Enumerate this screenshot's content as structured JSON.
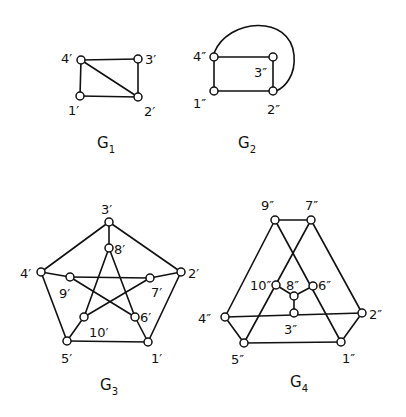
{
  "figure": {
    "width": 406,
    "height": 417,
    "ink_color": "#111111",
    "background": "#ffffff",
    "vertex_radius": 4
  },
  "graphs": [
    {
      "id": "G1",
      "title": "G",
      "subscript": "1",
      "title_pos": [
        97,
        148
      ],
      "vertices": [
        {
          "id": "1'",
          "label": "1'",
          "x": 80,
          "y": 96,
          "lx": 68,
          "ly": 115
        },
        {
          "id": "2'",
          "label": "2'",
          "x": 138,
          "y": 97,
          "lx": 144,
          "ly": 116
        },
        {
          "id": "3'",
          "label": "3'",
          "x": 138,
          "y": 59,
          "lx": 145,
          "ly": 64
        },
        {
          "id": "4'",
          "label": "4'",
          "x": 81,
          "y": 60,
          "lx": 61,
          "ly": 63
        }
      ],
      "edges": [
        [
          "4'",
          "3'"
        ],
        [
          "4'",
          "1'"
        ],
        [
          "1'",
          "2'"
        ],
        [
          "3'",
          "2'"
        ],
        [
          "4'",
          "2'"
        ]
      ],
      "arcs": []
    },
    {
      "id": "G2",
      "title": "G",
      "subscript": "2",
      "title_pos": [
        238,
        148
      ],
      "vertices": [
        {
          "id": "1''",
          "label": "1''",
          "x": 214,
          "y": 91,
          "lx": 193,
          "ly": 108
        },
        {
          "id": "2''",
          "label": "2''",
          "x": 273,
          "y": 91,
          "lx": 267,
          "ly": 114
        },
        {
          "id": "3''",
          "label": "3''",
          "x": 273,
          "y": 57,
          "lx": 254,
          "ly": 77
        },
        {
          "id": "4''",
          "label": "4''",
          "x": 214,
          "y": 57,
          "lx": 193,
          "ly": 61
        }
      ],
      "edges": [
        [
          "4''",
          "3''"
        ],
        [
          "4''",
          "1''"
        ],
        [
          "1''",
          "2''"
        ],
        [
          "3''",
          "2''"
        ]
      ],
      "arcs": [
        {
          "from": "4''",
          "to": "2''",
          "path": "M 214 53 C 228 18, 290 14, 294 55 C 296 76, 284 88, 276 91"
        }
      ]
    },
    {
      "id": "G3",
      "title": "G",
      "subscript": "3",
      "title_pos": [
        100,
        390
      ],
      "vertices": [
        {
          "id": "1'",
          "label": "1'",
          "x": 148,
          "y": 342,
          "lx": 151,
          "ly": 363
        },
        {
          "id": "2'",
          "label": "2'",
          "x": 181,
          "y": 272,
          "lx": 188,
          "ly": 278
        },
        {
          "id": "3'",
          "label": "3'",
          "x": 109,
          "y": 222,
          "lx": 101,
          "ly": 214
        },
        {
          "id": "4'",
          "label": "4'",
          "x": 41,
          "y": 272,
          "lx": 20,
          "ly": 278
        },
        {
          "id": "5'",
          "label": "5'",
          "x": 67,
          "y": 341,
          "lx": 61,
          "ly": 363
        },
        {
          "id": "6'",
          "label": "6'",
          "x": 135,
          "y": 317,
          "lx": 140,
          "ly": 322
        },
        {
          "id": "7'",
          "label": "7'",
          "x": 150,
          "y": 278,
          "lx": 151,
          "ly": 297
        },
        {
          "id": "8'",
          "label": "8'",
          "x": 109,
          "y": 248,
          "lx": 114,
          "ly": 254
        },
        {
          "id": "9'",
          "label": "9'",
          "x": 70,
          "y": 277,
          "lx": 59,
          "ly": 298
        },
        {
          "id": "10'",
          "label": "10'",
          "x": 84,
          "y": 317,
          "lx": 89,
          "ly": 337
        }
      ],
      "edges": [
        [
          "3'",
          "4'"
        ],
        [
          "3'",
          "2'"
        ],
        [
          "2'",
          "1'"
        ],
        [
          "1'",
          "5'"
        ],
        [
          "5'",
          "4'"
        ],
        [
          "3'",
          "8'"
        ],
        [
          "4'",
          "9'"
        ],
        [
          "2'",
          "7'"
        ],
        [
          "1'",
          "6'"
        ],
        [
          "5'",
          "10'"
        ],
        [
          "8'",
          "10'"
        ],
        [
          "8'",
          "6'"
        ],
        [
          "9'",
          "7'"
        ],
        [
          "9'",
          "6'"
        ],
        [
          "10'",
          "7'"
        ]
      ],
      "arcs": []
    },
    {
      "id": "G4",
      "title": "G",
      "subscript": "4",
      "title_pos": [
        290,
        387
      ],
      "vertices": [
        {
          "id": "1''",
          "label": "1''",
          "x": 341,
          "y": 342,
          "lx": 342,
          "ly": 363
        },
        {
          "id": "2''",
          "label": "2''",
          "x": 362,
          "y": 313,
          "lx": 369,
          "ly": 319
        },
        {
          "id": "3''",
          "label": "3''",
          "x": 294,
          "y": 313,
          "lx": 284,
          "ly": 334
        },
        {
          "id": "4''",
          "label": "4''",
          "x": 225,
          "y": 317,
          "lx": 198,
          "ly": 323
        },
        {
          "id": "5''",
          "label": "5''",
          "x": 244,
          "y": 343,
          "lx": 231,
          "ly": 364
        },
        {
          "id": "6''",
          "label": "6''",
          "x": 313,
          "y": 286,
          "lx": 318,
          "ly": 290
        },
        {
          "id": "7''",
          "label": "7''",
          "x": 311,
          "y": 220,
          "lx": 305,
          "ly": 210
        },
        {
          "id": "8''",
          "label": "8''",
          "x": 294,
          "y": 296,
          "lx": 286,
          "ly": 290
        },
        {
          "id": "9''",
          "label": "9''",
          "x": 275,
          "y": 220,
          "lx": 261,
          "ly": 210
        },
        {
          "id": "10''",
          "label": "10''",
          "x": 276,
          "y": 285,
          "lx": 250,
          "ly": 290
        }
      ],
      "edges": [
        [
          "9''",
          "7''"
        ],
        [
          "9''",
          "4''"
        ],
        [
          "9''",
          "1''"
        ],
        [
          "7''",
          "2''"
        ],
        [
          "7''",
          "5''"
        ],
        [
          "4''",
          "2''"
        ],
        [
          "4''",
          "5''"
        ],
        [
          "5''",
          "1''"
        ],
        [
          "1''",
          "2''"
        ],
        [
          "3''",
          "8''"
        ],
        [
          "8''",
          "10''"
        ],
        [
          "8''",
          "6''"
        ]
      ],
      "arcs": []
    }
  ]
}
